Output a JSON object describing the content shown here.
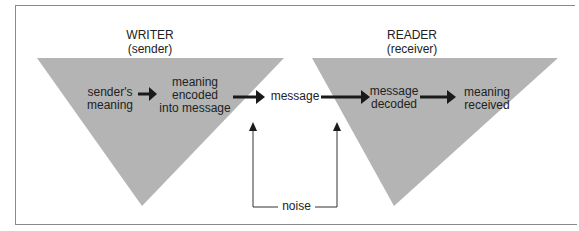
{
  "diagram": {
    "colors": {
      "triangle_fill": "#b4b4b4",
      "arrow": "#1a1a1a",
      "frame": "#8a8a8a",
      "background": "#ffffff"
    },
    "writer": {
      "title": "WRITER",
      "subtitle": "(sender)",
      "steps": [
        {
          "line1": "sender's",
          "line2": "meaning"
        },
        {
          "line1": "meaning",
          "line2": "encoded",
          "line3": "into message"
        }
      ]
    },
    "channel": {
      "message": "message",
      "noise": "noise"
    },
    "reader": {
      "title": "READER",
      "subtitle": "(receiver)",
      "steps": [
        {
          "line1": "message",
          "line2": "decoded"
        },
        {
          "line1": "meaning",
          "line2": "received"
        }
      ]
    }
  }
}
